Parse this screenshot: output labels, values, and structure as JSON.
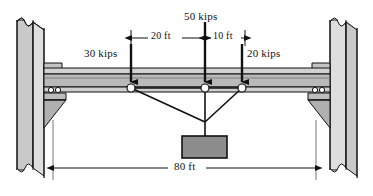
{
  "figure": {
    "type": "structural-free-body-diagram",
    "units": "kips / feet"
  },
  "loads": [
    {
      "id": "load-left",
      "label": "30 kips",
      "magnitude": 30,
      "units": "kips",
      "x_px": 131,
      "direction": "down"
    },
    {
      "id": "load-center",
      "label": "50 kips",
      "magnitude": 50,
      "units": "kips",
      "x_px": 205,
      "direction": "down"
    },
    {
      "id": "load-right",
      "label": "20 kips",
      "magnitude": 20,
      "units": "kips",
      "x_px": 242,
      "direction": "down"
    }
  ],
  "dimensions": [
    {
      "id": "dim-20ft",
      "label": "20 ft",
      "value": 20,
      "units": "ft",
      "from": "load-left",
      "to": "load-center",
      "position": "top"
    },
    {
      "id": "dim-10ft",
      "label": "10 ft",
      "value": 10,
      "units": "ft",
      "from": "load-center",
      "to": "load-right",
      "position": "top"
    },
    {
      "id": "dim-80ft",
      "label": "80 ft",
      "value": 80,
      "units": "ft",
      "from": "left-support",
      "to": "right-support",
      "position": "bottom"
    }
  ],
  "nodes": [
    {
      "id": "node-left",
      "x_px": 131,
      "y_px": 87
    },
    {
      "id": "node-center",
      "x_px": 205,
      "y_px": 87
    },
    {
      "id": "node-right",
      "x_px": 242,
      "y_px": 87
    }
  ],
  "apex": {
    "id": "cable-apex",
    "x_px": 205,
    "y_px": 122
  },
  "hanging_block": {
    "id": "suspended-load-block",
    "x_px": 182,
    "y_px": 136,
    "w_px": 45,
    "h_px": 22
  },
  "colors": {
    "outline": "#111111",
    "beam_fill": "#b9b9b9",
    "beam_flange": "#d2d2d2",
    "column_fill": "#c0c0c0",
    "column_light": "#d8d8d8",
    "corbel_fill": "#a8a8a8",
    "block_fill": "#8d8d8d",
    "background": "#ffffff"
  },
  "icons": {
    "load_arrow": "down-arrow-icon",
    "pin_node": "pin-node-icon",
    "roller": "roller-icon",
    "break_symbol": "break-symbol-icon",
    "dimension_arrow": "dimension-arrow-icon"
  }
}
